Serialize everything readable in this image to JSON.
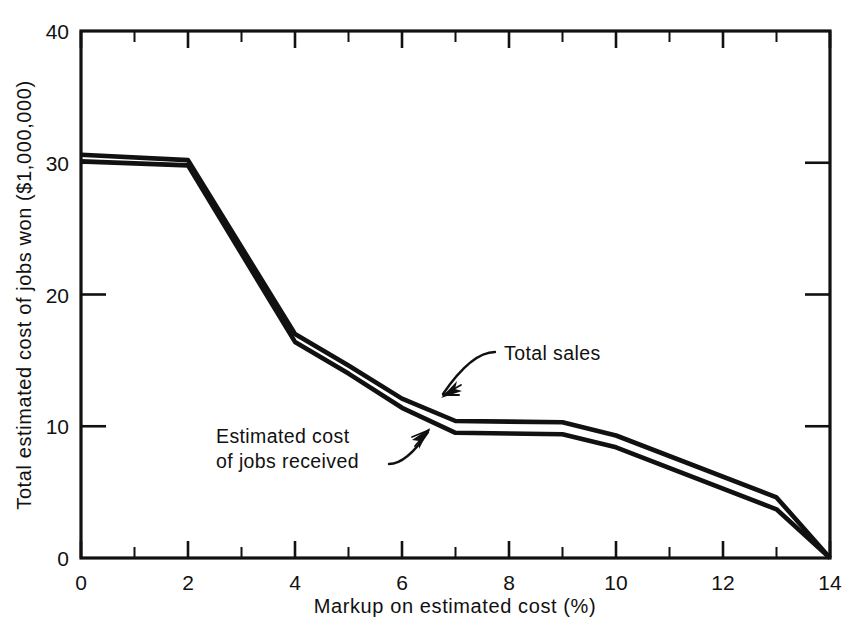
{
  "figure": {
    "background": "#ffffff",
    "ink_color": "#111111"
  },
  "chart_data": {
    "type": "line",
    "title": "",
    "xlabel": "Markup on estimated cost (%)",
    "ylabel": "Total estimated cost of jobs won ($1,000,000)",
    "xlim": [
      0,
      14
    ],
    "ylim": [
      0,
      40
    ],
    "grid": false,
    "legend_position": "inline-annotations",
    "x_major_ticks": [
      0,
      2,
      4,
      6,
      8,
      10,
      12,
      14
    ],
    "x_major_tick_labels": [
      "0",
      "2",
      "4",
      "6",
      "8",
      "10",
      "12",
      "14"
    ],
    "x_minor_ticks": [
      1,
      3,
      5,
      7,
      9,
      11,
      13
    ],
    "y_major_ticks": [
      0,
      10,
      20,
      30,
      40
    ],
    "y_major_tick_labels": [
      "0",
      "10",
      "20",
      "30",
      "40"
    ],
    "frame": "full-box",
    "tick_direction": "inward",
    "series": [
      {
        "name": "Total sales",
        "x": [
          0,
          2,
          4,
          5,
          6,
          7,
          9,
          10,
          13,
          14
        ],
        "values": [
          30.6,
          30.2,
          17.0,
          14.6,
          12.1,
          10.4,
          10.3,
          9.3,
          4.6,
          0.0
        ]
      },
      {
        "name": "Estimated cost of jobs received",
        "x": [
          0,
          2,
          4,
          5,
          6,
          7,
          9,
          10,
          13,
          14
        ],
        "values": [
          30.1,
          29.8,
          16.4,
          14.0,
          11.4,
          9.5,
          9.4,
          8.4,
          3.7,
          0.0
        ]
      }
    ],
    "annotations": [
      {
        "label": "Total sales",
        "text_x": 14.0,
        "text_y": 0.0,
        "points_to_series": "Total sales"
      },
      {
        "label_line_1": "Estimated cost",
        "label_line_2": "of jobs received",
        "points_to_series": "Estimated cost of jobs received"
      }
    ]
  },
  "annotations": {
    "total_sales": "Total sales",
    "estimated_cost_line1": "Estimated cost",
    "estimated_cost_line2": "of jobs received"
  },
  "axes": {
    "x_title": "Markup on estimated cost (%)",
    "y_title": "Total estimated cost of jobs won ($1,000,000)",
    "x_labels": [
      "0",
      "2",
      "4",
      "6",
      "8",
      "10",
      "12",
      "14"
    ],
    "y_labels": [
      "0",
      "10",
      "20",
      "30",
      "40"
    ]
  }
}
